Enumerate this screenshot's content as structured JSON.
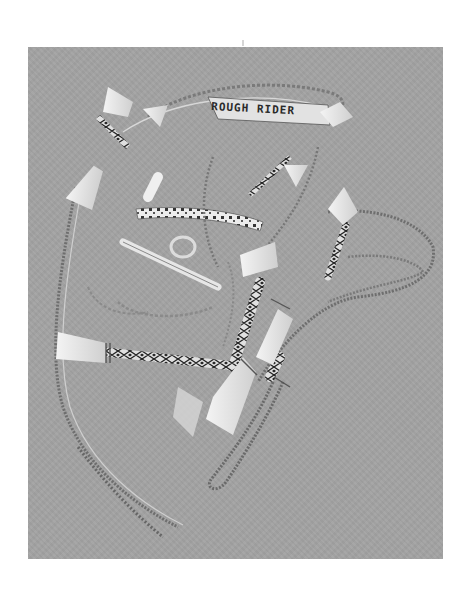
{
  "image": {
    "subject": "braided horsehair bridle with tassels and bit",
    "headband_text": "ROUGH RIDER",
    "background_color": "#a3a3a3",
    "page_color": "#ffffff",
    "tassel_color": "#e8e8e8",
    "cord_color": "#707070"
  }
}
